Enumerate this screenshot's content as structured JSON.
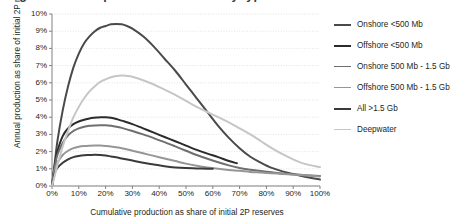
{
  "title_fragment": "Figure: Decline profiles of oil fields by type and size",
  "axes": {
    "ylabel": "Annual production as share of initial 2P reserves",
    "xlabel": "Cumulative production as share of initial 2P reserves",
    "yticks": [
      "0%",
      "1%",
      "2%",
      "3%",
      "4%",
      "5%",
      "6%",
      "7%",
      "8%",
      "9%",
      "10%"
    ],
    "xticks": [
      "0%",
      "10%",
      "20%",
      "30%",
      "40%",
      "50%",
      "60%",
      "70%",
      "80%",
      "90%",
      "100%"
    ]
  },
  "chart_data": {
    "type": "line",
    "title": "",
    "xlabel": "Cumulative production as share of initial 2P reserves",
    "ylabel": "Annual production as share of initial 2P reserves",
    "xlim": [
      0,
      100
    ],
    "ylim": [
      0,
      10
    ],
    "grid": true,
    "legend_position": "right",
    "series": [
      {
        "name": "Onshore <500 Mb",
        "color": "#4a4a4a",
        "width": 2.0,
        "points": [
          [
            0,
            0.0
          ],
          [
            1,
            1.3
          ],
          [
            2,
            2.6
          ],
          [
            4,
            4.4
          ],
          [
            6,
            5.8
          ],
          [
            8,
            6.9
          ],
          [
            10,
            7.7
          ],
          [
            12,
            8.3
          ],
          [
            14,
            8.7
          ],
          [
            16,
            9.0
          ],
          [
            18,
            9.2
          ],
          [
            20,
            9.3
          ],
          [
            22,
            9.4
          ],
          [
            24,
            9.42
          ],
          [
            26,
            9.4
          ],
          [
            28,
            9.3
          ],
          [
            30,
            9.15
          ],
          [
            34,
            8.7
          ],
          [
            38,
            8.1
          ],
          [
            42,
            7.4
          ],
          [
            46,
            6.7
          ],
          [
            50,
            5.9
          ],
          [
            54,
            5.1
          ],
          [
            58,
            4.3
          ],
          [
            62,
            3.5
          ],
          [
            66,
            2.8
          ],
          [
            70,
            2.2
          ],
          [
            74,
            1.7
          ],
          [
            78,
            1.35
          ],
          [
            82,
            1.05
          ],
          [
            86,
            0.85
          ],
          [
            90,
            0.7
          ],
          [
            94,
            0.55
          ],
          [
            100,
            0.38
          ]
        ]
      },
      {
        "name": "Offshore <500 Mb",
        "color": "#2b2b2b",
        "width": 2.0,
        "points": [
          [
            0,
            0.0
          ],
          [
            1,
            1.2
          ],
          [
            2,
            2.0
          ],
          [
            4,
            2.9
          ],
          [
            6,
            3.35
          ],
          [
            8,
            3.6
          ],
          [
            10,
            3.75
          ],
          [
            12,
            3.85
          ],
          [
            14,
            3.93
          ],
          [
            16,
            3.97
          ],
          [
            18,
            4.0
          ],
          [
            20,
            4.0
          ],
          [
            22,
            3.97
          ],
          [
            24,
            3.9
          ],
          [
            26,
            3.8
          ],
          [
            30,
            3.6
          ],
          [
            34,
            3.35
          ],
          [
            38,
            3.1
          ],
          [
            42,
            2.85
          ],
          [
            46,
            2.6
          ],
          [
            50,
            2.35
          ],
          [
            54,
            2.1
          ],
          [
            58,
            1.88
          ],
          [
            62,
            1.68
          ],
          [
            66,
            1.45
          ],
          [
            69,
            1.32
          ]
        ]
      },
      {
        "name": "Onshore 500 Mb - 1.5 Gb",
        "color": "#6f6f6f",
        "width": 2.0,
        "points": [
          [
            0,
            0.0
          ],
          [
            1,
            1.1
          ],
          [
            2,
            1.8
          ],
          [
            4,
            2.5
          ],
          [
            6,
            2.95
          ],
          [
            8,
            3.2
          ],
          [
            10,
            3.35
          ],
          [
            12,
            3.45
          ],
          [
            14,
            3.5
          ],
          [
            16,
            3.52
          ],
          [
            18,
            3.53
          ],
          [
            20,
            3.53
          ],
          [
            22,
            3.5
          ],
          [
            24,
            3.45
          ],
          [
            26,
            3.38
          ],
          [
            30,
            3.2
          ],
          [
            34,
            3.0
          ],
          [
            38,
            2.78
          ],
          [
            42,
            2.55
          ],
          [
            46,
            2.3
          ],
          [
            50,
            2.05
          ],
          [
            54,
            1.8
          ],
          [
            58,
            1.58
          ],
          [
            62,
            1.38
          ],
          [
            66,
            1.2
          ],
          [
            70,
            1.05
          ],
          [
            74,
            0.95
          ],
          [
            78,
            0.87
          ],
          [
            82,
            0.8
          ],
          [
            86,
            0.73
          ],
          [
            90,
            0.68
          ],
          [
            94,
            0.63
          ],
          [
            100,
            0.58
          ]
        ]
      },
      {
        "name": "Offshore 500 Mb - 1.5 Gb",
        "color": "#969696",
        "width": 2.0,
        "points": [
          [
            0,
            0.0
          ],
          [
            1,
            0.9
          ],
          [
            2,
            1.35
          ],
          [
            4,
            1.8
          ],
          [
            6,
            2.05
          ],
          [
            8,
            2.2
          ],
          [
            10,
            2.28
          ],
          [
            12,
            2.32
          ],
          [
            14,
            2.34
          ],
          [
            16,
            2.35
          ],
          [
            18,
            2.35
          ],
          [
            20,
            2.33
          ],
          [
            22,
            2.3
          ],
          [
            24,
            2.25
          ],
          [
            26,
            2.2
          ],
          [
            30,
            2.05
          ],
          [
            34,
            1.9
          ],
          [
            38,
            1.75
          ],
          [
            42,
            1.6
          ],
          [
            46,
            1.45
          ],
          [
            50,
            1.3
          ],
          [
            54,
            1.18
          ],
          [
            58,
            1.08
          ],
          [
            62,
            1.0
          ],
          [
            66,
            0.93
          ],
          [
            70,
            0.88
          ],
          [
            74,
            0.82
          ],
          [
            78,
            0.78
          ],
          [
            82,
            0.74
          ],
          [
            86,
            0.7
          ],
          [
            90,
            0.66
          ],
          [
            94,
            0.62
          ],
          [
            100,
            0.55
          ]
        ]
      },
      {
        "name": "All >1.5 Gb",
        "color": "#3a3a3a",
        "width": 2.0,
        "points": [
          [
            0,
            0.0
          ],
          [
            1,
            0.75
          ],
          [
            2,
            1.05
          ],
          [
            4,
            1.35
          ],
          [
            6,
            1.55
          ],
          [
            8,
            1.68
          ],
          [
            10,
            1.75
          ],
          [
            12,
            1.79
          ],
          [
            14,
            1.8
          ],
          [
            16,
            1.81
          ],
          [
            18,
            1.8
          ],
          [
            20,
            1.77
          ],
          [
            22,
            1.72
          ],
          [
            24,
            1.67
          ],
          [
            26,
            1.6
          ],
          [
            30,
            1.48
          ],
          [
            34,
            1.35
          ],
          [
            38,
            1.25
          ],
          [
            42,
            1.15
          ],
          [
            46,
            1.08
          ],
          [
            50,
            1.04
          ],
          [
            54,
            1.02
          ],
          [
            58,
            1.0
          ],
          [
            60,
            1.0
          ]
        ]
      },
      {
        "name": "Deepwater",
        "color": "#c6c6c6",
        "width": 2.0,
        "points": [
          [
            0,
            0.0
          ],
          [
            1,
            0.6
          ],
          [
            2,
            1.2
          ],
          [
            4,
            2.3
          ],
          [
            6,
            3.2
          ],
          [
            8,
            4.0
          ],
          [
            10,
            4.6
          ],
          [
            12,
            5.1
          ],
          [
            14,
            5.5
          ],
          [
            16,
            5.8
          ],
          [
            18,
            6.05
          ],
          [
            20,
            6.2
          ],
          [
            22,
            6.32
          ],
          [
            24,
            6.4
          ],
          [
            26,
            6.43
          ],
          [
            28,
            6.4
          ],
          [
            30,
            6.35
          ],
          [
            34,
            6.15
          ],
          [
            38,
            5.9
          ],
          [
            42,
            5.6
          ],
          [
            46,
            5.3
          ],
          [
            50,
            4.95
          ],
          [
            54,
            4.6
          ],
          [
            58,
            4.3
          ],
          [
            62,
            4.0
          ],
          [
            66,
            3.7
          ],
          [
            70,
            3.35
          ],
          [
            74,
            3.0
          ],
          [
            78,
            2.6
          ],
          [
            82,
            2.2
          ],
          [
            86,
            1.85
          ],
          [
            90,
            1.55
          ],
          [
            94,
            1.3
          ],
          [
            100,
            1.1
          ]
        ]
      }
    ]
  },
  "legend": {
    "items": [
      {
        "label": "Onshore <500 Mb",
        "color": "#4a4a4a",
        "width": 2.0
      },
      {
        "label": "Offshore <500 Mb",
        "color": "#2b2b2b",
        "width": 2.2
      },
      {
        "label": "Onshore 500 Mb - 1.5 Gb",
        "color": "#6f6f6f",
        "width": 1.8
      },
      {
        "label": "Offshore 500 Mb - 1.5 Gb",
        "color": "#969696",
        "width": 1.8
      },
      {
        "label": "All >1.5 Gb",
        "color": "#3a3a3a",
        "width": 2.2
      },
      {
        "label": "Deepwater",
        "color": "#c6c6c6",
        "width": 1.8
      }
    ]
  },
  "style": {
    "grid_color": "#d9d9d9",
    "axis_color": "#808080",
    "text_color": "#231f20"
  }
}
